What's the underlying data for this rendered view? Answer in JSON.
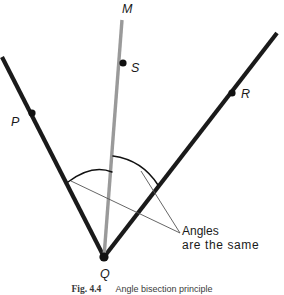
{
  "figure": {
    "caption_number": "Fig. 4.4",
    "caption_text": "Angle bisection principle",
    "annotation_line_1": "Angles",
    "annotation_line_2": "are the same"
  },
  "points": {
    "M": {
      "label": "M",
      "x": 122,
      "y": 20
    },
    "S": {
      "label": "S",
      "x": 123,
      "y": 63
    },
    "P": {
      "label": "P",
      "x": 32,
      "y": 113
    },
    "R": {
      "label": "R",
      "x": 232,
      "y": 93
    },
    "Q": {
      "label": "Q",
      "x": 104,
      "y": 257
    }
  },
  "geometry": {
    "vertex": {
      "x": 104,
      "y": 257
    },
    "ray_left_end": {
      "x": 2,
      "y": 57
    },
    "ray_right_end": {
      "x": 277,
      "y": 33
    },
    "bisector_end": {
      "x": 122,
      "y": 20
    },
    "arc_left_path": "M 68 182 Q 92 164 112 172",
    "arc_right_path": "M 113 156 Q 142 160 158 185",
    "leader_left_path": "M 180 233 L 71 181",
    "leader_right_path": "M 180 233 L 141 171",
    "ray_stroke_width": 4.2,
    "bisector_stroke_width": 3.4,
    "arc_stroke_width": 1.5,
    "leader_stroke_width": 0.9,
    "dot_radius": 3.6,
    "vertex_dot_radius": 4.6
  },
  "colors": {
    "ray": "#1a1a1a",
    "bisector": "#9a9a9a",
    "arc": "#111111",
    "leader": "#555555",
    "dot": "#111111",
    "text": "#1a1a1a",
    "background": "#ffffff"
  }
}
